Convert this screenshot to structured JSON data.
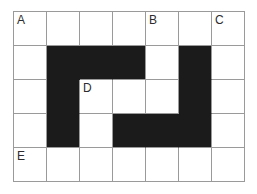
{
  "figure": {
    "grid": {
      "rows": 5,
      "cols": 7,
      "cell_width": 33,
      "cell_height": 34,
      "filled_cells": [
        [
          1,
          1
        ],
        [
          1,
          2
        ],
        [
          1,
          3
        ],
        [
          1,
          5
        ],
        [
          2,
          1
        ],
        [
          2,
          5
        ],
        [
          3,
          1
        ],
        [
          3,
          3
        ],
        [
          3,
          4
        ],
        [
          3,
          5
        ]
      ],
      "labels": [
        {
          "text": "A",
          "row": 0,
          "col": 0
        },
        {
          "text": "B",
          "row": 0,
          "col": 4
        },
        {
          "text": "C",
          "row": 0,
          "col": 6
        },
        {
          "text": "D",
          "row": 2,
          "col": 2
        },
        {
          "text": "E",
          "row": 4,
          "col": 0
        }
      ]
    },
    "colors": {
      "background": "#ffffff",
      "grid_line": "#9a9a9a",
      "fill": "#1b1b1b",
      "label_text": "#2c2c2c"
    }
  }
}
